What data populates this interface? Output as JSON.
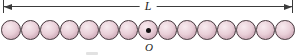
{
  "figure": {
    "length_label": "L",
    "origin_label": "O",
    "sphere_count": 15,
    "center_sphere_index": 7,
    "colors": {
      "background": "#ffffff",
      "sphere_fill": "#e9cfd8",
      "sphere_highlight": "#f7ebef",
      "sphere_shadow": "#c59fae",
      "sphere_outline": "#43343a",
      "dimension_line": "#3b3b3b",
      "label_text": "#1d1d1d",
      "center_dot": "#111111"
    }
  }
}
